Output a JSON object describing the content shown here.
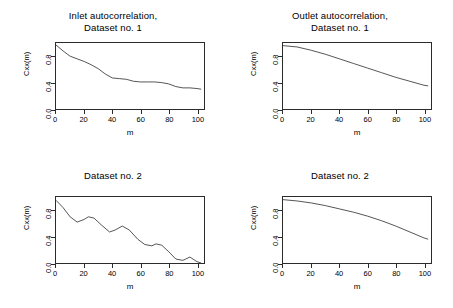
{
  "figure": {
    "background": "#ffffff",
    "line_color": "#2b2b2b",
    "frame_color": "#2b2b2b"
  },
  "axis": {
    "xlabel": "m",
    "ylabel": "Cxx(m)",
    "xticks": [
      "0",
      "20",
      "40",
      "60",
      "80",
      "100"
    ],
    "yticks": [
      "0.0",
      "0.4",
      "0.8"
    ],
    "xlim": [
      0,
      105
    ],
    "ylim": [
      0.0,
      1.0
    ]
  },
  "panels": [
    {
      "id": "inlet-dataset-1",
      "title_line1": "Inlet autocorrelation,",
      "title_line2": "Dataset no. 1"
    },
    {
      "id": "outlet-dataset-1",
      "title_line1": "Outlet autocorrelation,",
      "title_line2": "Dataset no. 1"
    },
    {
      "id": "inlet-dataset-2",
      "title_line1": "Dataset no. 2",
      "title_line2": ""
    },
    {
      "id": "outlet-dataset-2",
      "title_line1": "Dataset no. 2",
      "title_line2": ""
    }
  ],
  "chart_data": [
    {
      "type": "line",
      "title": "Inlet autocorrelation, Dataset no. 1",
      "xlabel": "m",
      "ylabel": "Cxx(m)",
      "xlim": [
        0,
        105
      ],
      "ylim": [
        0.0,
        1.0
      ],
      "grid": false,
      "legend": "none",
      "x": [
        0,
        5,
        10,
        15,
        20,
        25,
        30,
        35,
        40,
        45,
        50,
        55,
        60,
        65,
        70,
        75,
        80,
        85,
        90,
        95,
        100,
        103
      ],
      "y": [
        0.97,
        0.88,
        0.8,
        0.76,
        0.72,
        0.67,
        0.61,
        0.53,
        0.47,
        0.46,
        0.45,
        0.42,
        0.41,
        0.41,
        0.41,
        0.4,
        0.38,
        0.34,
        0.32,
        0.32,
        0.31,
        0.3
      ]
    },
    {
      "type": "line",
      "title": "Outlet autocorrelation, Dataset no. 1",
      "xlabel": "m",
      "ylabel": "Cxx(m)",
      "xlim": [
        0,
        105
      ],
      "ylim": [
        0.0,
        1.0
      ],
      "grid": false,
      "legend": "none",
      "x": [
        0,
        10,
        20,
        30,
        40,
        50,
        60,
        70,
        80,
        90,
        100,
        103
      ],
      "y": [
        0.96,
        0.94,
        0.89,
        0.83,
        0.76,
        0.69,
        0.62,
        0.55,
        0.48,
        0.42,
        0.36,
        0.35
      ]
    },
    {
      "type": "line",
      "title": "Dataset no. 2",
      "xlabel": "m",
      "ylabel": "Cxx(m)",
      "xlim": [
        0,
        105
      ],
      "ylim": [
        0.0,
        1.0
      ],
      "grid": false,
      "legend": "none",
      "x": [
        0,
        5,
        10,
        15,
        20,
        23,
        27,
        32,
        38,
        42,
        47,
        52,
        58,
        63,
        68,
        71,
        75,
        80,
        85,
        90,
        95,
        100,
        103
      ],
      "y": [
        0.95,
        0.84,
        0.7,
        0.62,
        0.66,
        0.7,
        0.68,
        0.58,
        0.47,
        0.5,
        0.56,
        0.5,
        0.36,
        0.28,
        0.26,
        0.29,
        0.27,
        0.17,
        0.06,
        0.04,
        0.09,
        0.02,
        0.0
      ]
    },
    {
      "type": "line",
      "title": "Dataset no. 2",
      "xlabel": "m",
      "ylabel": "Cxx(m)",
      "xlim": [
        0,
        105
      ],
      "ylim": [
        0.0,
        1.0
      ],
      "grid": false,
      "legend": "none",
      "x": [
        0,
        10,
        20,
        30,
        40,
        50,
        60,
        70,
        80,
        90,
        100,
        103
      ],
      "y": [
        0.96,
        0.94,
        0.91,
        0.87,
        0.82,
        0.77,
        0.71,
        0.64,
        0.56,
        0.47,
        0.38,
        0.36
      ]
    }
  ]
}
